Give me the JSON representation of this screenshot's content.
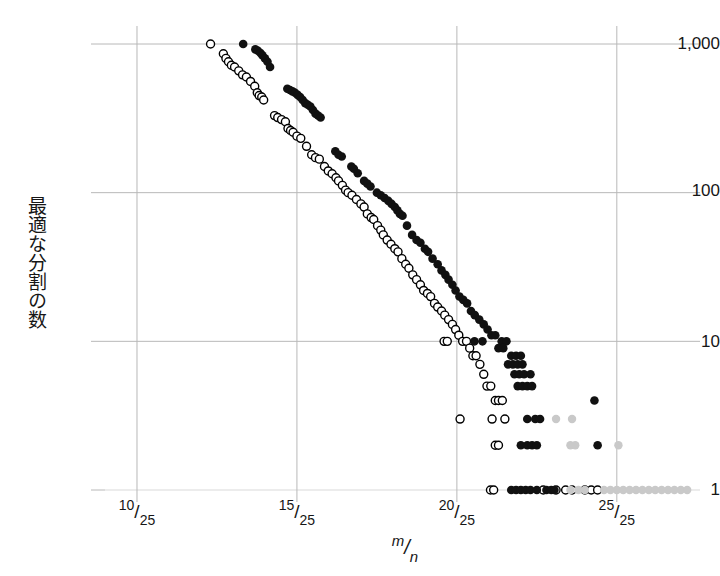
{
  "chart_data": {
    "type": "scatter",
    "title": "",
    "xlabel": "m/n",
    "ylabel": "最適な分割の数",
    "yscale": "log",
    "ylim": [
      1,
      1000
    ],
    "xlim": [
      9.0,
      27.6
    ],
    "grid": true,
    "legend_position": "none",
    "x_denominator": 25,
    "ytick_labels": [
      "1,000",
      "100",
      "10",
      "1"
    ],
    "ytick_values": [
      1000,
      100,
      10,
      1
    ],
    "xtick_labels": [
      "10/25",
      "15/25",
      "20/25",
      "25/25"
    ],
    "xtick_numerators": [
      "10",
      "15",
      "20",
      "25"
    ],
    "xtick_denominators": [
      "25",
      "25",
      "25",
      "25"
    ],
    "xtick_values": [
      10,
      15,
      20,
      25
    ],
    "series": [
      {
        "name": "open-circles",
        "marker": "open-circle",
        "color": "#000000",
        "fill": "#ffffff",
        "points": [
          [
            12.3,
            1000
          ],
          [
            12.7,
            860
          ],
          [
            12.78,
            800
          ],
          [
            12.86,
            760
          ],
          [
            12.95,
            720
          ],
          [
            13.05,
            700
          ],
          [
            13.18,
            660
          ],
          [
            13.3,
            620
          ],
          [
            13.42,
            600
          ],
          [
            13.55,
            560
          ],
          [
            13.68,
            520
          ],
          [
            13.76,
            470
          ],
          [
            13.82,
            450
          ],
          [
            13.9,
            440
          ],
          [
            13.96,
            420
          ],
          [
            14.3,
            330
          ],
          [
            14.4,
            320
          ],
          [
            14.52,
            310
          ],
          [
            14.64,
            300
          ],
          [
            14.72,
            270
          ],
          [
            14.8,
            262
          ],
          [
            14.88,
            255
          ],
          [
            15.0,
            240
          ],
          [
            15.12,
            232
          ],
          [
            15.3,
            205
          ],
          [
            15.46,
            180
          ],
          [
            15.58,
            172
          ],
          [
            15.7,
            168
          ],
          [
            15.86,
            150
          ],
          [
            15.98,
            140
          ],
          [
            16.1,
            134
          ],
          [
            16.22,
            126
          ],
          [
            16.3,
            120
          ],
          [
            16.42,
            112
          ],
          [
            16.52,
            104
          ],
          [
            16.6,
            100
          ],
          [
            16.72,
            96
          ],
          [
            16.86,
            90
          ],
          [
            17.0,
            84
          ],
          [
            17.1,
            80
          ],
          [
            17.2,
            72
          ],
          [
            17.32,
            68
          ],
          [
            17.4,
            66
          ],
          [
            17.52,
            60
          ],
          [
            17.62,
            56
          ],
          [
            17.7,
            52
          ],
          [
            17.82,
            48
          ],
          [
            17.94,
            45
          ],
          [
            18.06,
            42
          ],
          [
            18.16,
            40
          ],
          [
            18.28,
            36
          ],
          [
            18.4,
            33
          ],
          [
            18.5,
            31
          ],
          [
            18.62,
            28
          ],
          [
            18.74,
            26
          ],
          [
            18.86,
            24
          ],
          [
            18.96,
            22
          ],
          [
            19.08,
            21
          ],
          [
            19.18,
            20
          ],
          [
            19.3,
            18
          ],
          [
            19.4,
            17
          ],
          [
            19.52,
            16
          ],
          [
            19.62,
            15
          ],
          [
            19.74,
            14
          ],
          [
            19.86,
            13
          ],
          [
            19.96,
            12
          ],
          [
            20.06,
            11
          ],
          [
            20.18,
            10
          ],
          [
            20.3,
            10
          ],
          [
            19.6,
            10
          ],
          [
            19.7,
            10
          ],
          [
            20.4,
            9
          ],
          [
            20.5,
            8
          ],
          [
            20.6,
            8
          ],
          [
            20.72,
            7
          ],
          [
            20.84,
            6
          ],
          [
            20.94,
            5
          ],
          [
            21.06,
            5
          ],
          [
            21.2,
            4
          ],
          [
            21.3,
            4
          ],
          [
            21.42,
            4
          ],
          [
            20.1,
            3
          ],
          [
            21.1,
            3
          ],
          [
            21.5,
            3
          ],
          [
            21.2,
            2
          ],
          [
            21.3,
            2
          ],
          [
            21.05,
            1
          ],
          [
            21.15,
            1
          ],
          [
            22.7,
            1
          ],
          [
            23.1,
            1
          ],
          [
            23.4,
            1
          ],
          [
            23.6,
            1
          ],
          [
            24.0,
            1
          ],
          [
            24.2,
            1
          ],
          [
            24.4,
            1
          ]
        ]
      },
      {
        "name": "filled-circles",
        "marker": "filled-circle",
        "color": "#111111",
        "fill": "#111111",
        "points": [
          [
            13.32,
            1000
          ],
          [
            13.7,
            920
          ],
          [
            13.78,
            900
          ],
          [
            13.86,
            870
          ],
          [
            13.92,
            840
          ],
          [
            14.0,
            800
          ],
          [
            14.08,
            760
          ],
          [
            14.16,
            700
          ],
          [
            14.7,
            500
          ],
          [
            14.78,
            490
          ],
          [
            14.86,
            480
          ],
          [
            14.94,
            470
          ],
          [
            15.02,
            455
          ],
          [
            15.1,
            440
          ],
          [
            15.18,
            420
          ],
          [
            15.26,
            400
          ],
          [
            15.34,
            390
          ],
          [
            15.42,
            380
          ],
          [
            15.5,
            360
          ],
          [
            15.58,
            340
          ],
          [
            15.66,
            330
          ],
          [
            15.74,
            320
          ],
          [
            16.2,
            190
          ],
          [
            16.3,
            180
          ],
          [
            16.4,
            175
          ],
          [
            16.7,
            150
          ],
          [
            16.78,
            145
          ],
          [
            16.9,
            135
          ],
          [
            17.1,
            120
          ],
          [
            17.2,
            115
          ],
          [
            17.3,
            110
          ],
          [
            17.5,
            100
          ],
          [
            17.62,
            96
          ],
          [
            17.74,
            92
          ],
          [
            17.86,
            88
          ],
          [
            17.96,
            84
          ],
          [
            18.06,
            80
          ],
          [
            18.14,
            76
          ],
          [
            18.22,
            72
          ],
          [
            18.3,
            70
          ],
          [
            18.44,
            60
          ],
          [
            18.6,
            52
          ],
          [
            18.74,
            48
          ],
          [
            18.86,
            46
          ],
          [
            19.0,
            42
          ],
          [
            19.1,
            40
          ],
          [
            19.24,
            36
          ],
          [
            19.4,
            33
          ],
          [
            19.52,
            30
          ],
          [
            19.64,
            28
          ],
          [
            19.74,
            26
          ],
          [
            19.86,
            24
          ],
          [
            19.96,
            22
          ],
          [
            20.08,
            20
          ],
          [
            20.2,
            19
          ],
          [
            20.32,
            18
          ],
          [
            20.44,
            16
          ],
          [
            20.56,
            15
          ],
          [
            20.7,
            14
          ],
          [
            20.84,
            13
          ],
          [
            20.96,
            12
          ],
          [
            21.08,
            11
          ],
          [
            21.2,
            11
          ],
          [
            20.55,
            10
          ],
          [
            20.8,
            10
          ],
          [
            21.4,
            10
          ],
          [
            21.55,
            10
          ],
          [
            21.3,
            9
          ],
          [
            21.45,
            9
          ],
          [
            21.7,
            8
          ],
          [
            21.85,
            8
          ],
          [
            22.0,
            8
          ],
          [
            21.6,
            7
          ],
          [
            21.75,
            7
          ],
          [
            21.9,
            7
          ],
          [
            22.05,
            7
          ],
          [
            21.8,
            6
          ],
          [
            21.95,
            6
          ],
          [
            22.1,
            6
          ],
          [
            22.3,
            6
          ],
          [
            21.9,
            5
          ],
          [
            22.05,
            5
          ],
          [
            22.2,
            5
          ],
          [
            22.35,
            5
          ],
          [
            24.3,
            4
          ],
          [
            22.2,
            3
          ],
          [
            22.45,
            3
          ],
          [
            22.6,
            3
          ],
          [
            22.0,
            2
          ],
          [
            22.2,
            2
          ],
          [
            22.35,
            2
          ],
          [
            22.5,
            2
          ],
          [
            24.4,
            2
          ],
          [
            21.7,
            1
          ],
          [
            21.85,
            1
          ],
          [
            22.0,
            1
          ],
          [
            22.15,
            1
          ],
          [
            22.3,
            1
          ],
          [
            22.5,
            1
          ],
          [
            22.8,
            1
          ],
          [
            22.95,
            1
          ],
          [
            23.05,
            1
          ]
        ]
      },
      {
        "name": "faint-gray-points",
        "marker": "faint-circle",
        "color": "#c9c9c9",
        "fill": "#c9c9c9",
        "points": [
          [
            23.1,
            3
          ],
          [
            23.6,
            3
          ],
          [
            23.55,
            2
          ],
          [
            23.7,
            2
          ],
          [
            25.05,
            2
          ],
          [
            23.55,
            1
          ],
          [
            23.8,
            1
          ],
          [
            24.0,
            1
          ],
          [
            24.6,
            1
          ],
          [
            24.8,
            1
          ],
          [
            25.0,
            1
          ],
          [
            25.2,
            1
          ],
          [
            25.4,
            1
          ],
          [
            25.6,
            1
          ],
          [
            25.8,
            1
          ],
          [
            26.0,
            1
          ],
          [
            26.2,
            1
          ],
          [
            26.4,
            1
          ],
          [
            26.6,
            1
          ],
          [
            26.8,
            1
          ],
          [
            27.0,
            1
          ],
          [
            27.2,
            1
          ]
        ]
      }
    ]
  },
  "axes": {
    "y_label_text": "最適な分割の数",
    "x_title_num": "m",
    "x_title_bar": "/",
    "x_title_den": "n",
    "ytick_1000": "1,000",
    "ytick_100": "100",
    "ytick_10": "10",
    "ytick_1": "1",
    "xtick_0_num": "10",
    "xtick_0_den": "25",
    "xtick_1_num": "15",
    "xtick_1_den": "25",
    "xtick_2_num": "20",
    "xtick_2_den": "25",
    "xtick_3_num": "25",
    "xtick_3_den": "25",
    "slash": "/"
  },
  "colors": {
    "grid": "#b8b8b8",
    "grid_minor": "#d9d9d9",
    "filled_marker": "#111111",
    "open_marker": "#000000",
    "faint_marker": "#c9c9c9",
    "text": "#161616",
    "background": "#ffffff"
  }
}
